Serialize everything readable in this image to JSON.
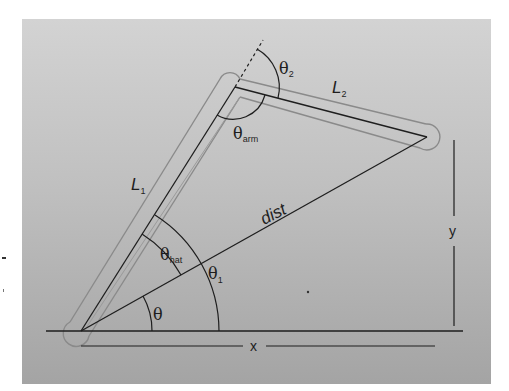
{
  "figure": {
    "colors": {
      "panel_top": "#d2d2d2",
      "panel_bottom": "#a6a6a6",
      "line": "#1e1e1e",
      "link_outline": "#8c8c8c"
    },
    "nodes": {
      "base": {
        "x": 81,
        "y": 331
      },
      "elbow": {
        "x": 235,
        "y": 87
      },
      "end_effector": {
        "x": 427,
        "y": 137
      }
    },
    "labels": {
      "L1_main": "L",
      "L1_sub": "1",
      "L2_main": "L",
      "L2_sub": "2",
      "dist": "dist",
      "theta": "θ",
      "theta_hat_main": "θ",
      "theta_hat_sub": "hat",
      "theta1_main": "θ",
      "theta1_sub": "1",
      "theta2_main": "θ",
      "theta2_sub": "2",
      "theta_arm_main": "θ",
      "theta_arm_sub": "arm",
      "x": "x",
      "y": "y"
    }
  }
}
